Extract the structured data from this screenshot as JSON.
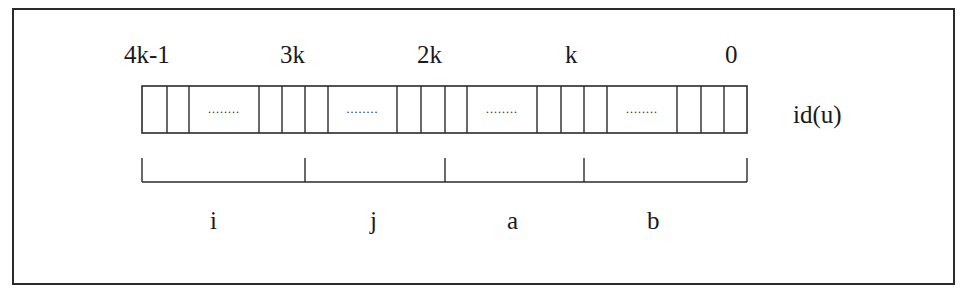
{
  "diagram": {
    "register_label": "id(u)",
    "bit_positions": [
      {
        "text": "4k-1",
        "x": 124
      },
      {
        "text": "3k",
        "x": 280
      },
      {
        "text": "2k",
        "x": 417
      },
      {
        "text": "k",
        "x": 565
      },
      {
        "text": "0",
        "x": 725
      }
    ],
    "fields": [
      {
        "name": "i",
        "x": 213
      },
      {
        "name": "j",
        "x": 373
      },
      {
        "name": "a",
        "x": 513
      },
      {
        "name": "b",
        "x": 653
      }
    ],
    "ellipsis": "........",
    "box": {
      "left": 142,
      "top": 86,
      "right": 747,
      "bottom": 133
    },
    "cell_dividers": [
      167,
      189,
      259,
      282,
      305,
      328,
      397,
      421,
      445,
      467,
      537,
      561,
      584,
      607,
      677,
      701,
      724
    ],
    "ellipsis_cells": [
      [
        189,
        259
      ],
      [
        328,
        397
      ],
      [
        467,
        537
      ],
      [
        607,
        677
      ]
    ],
    "bracket": {
      "tick_top": 158,
      "line_y": 182,
      "ticks": [
        142,
        305,
        445,
        584,
        747
      ]
    },
    "line_color": "#2a2a2a"
  }
}
